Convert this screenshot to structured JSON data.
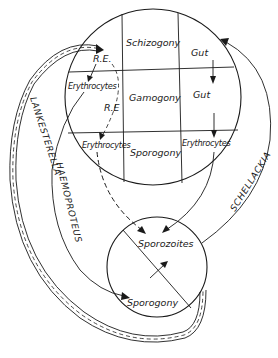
{
  "diagram": {
    "colors": {
      "ink": "#1a1a1a",
      "background": "#ffffff"
    },
    "host_circle": {
      "grid": {
        "rows": [
          [
            "R.E.",
            "Schizogony",
            "Gut"
          ],
          [
            "Erythrocytes",
            "Gamogony",
            "Gut"
          ],
          [
            "Erythrocytes",
            "Sporogony",
            "Erythrocytes"
          ]
        ],
        "row_labels": [
          "Schizogony",
          "Gamogony",
          "Sporogony"
        ]
      },
      "labels": {
        "re_top": "R.E.",
        "schizogony": "Schizogony",
        "gut_top": "Gut",
        "erythrocytes_mid": "Erythrocytes",
        "re_mid": "R.E",
        "gamogony": "Gamogony",
        "gut_mid": "Gut",
        "erythrocytes_left": "Erythrocytes",
        "sporogony": "Sporogony",
        "erythrocytes_right": "Erythrocytes"
      }
    },
    "vector_circle": {
      "labels": {
        "sporozoites": "Sporozoites",
        "sporogony": "Sporogony"
      }
    },
    "genus_paths": [
      {
        "name": "LANKESTERELLA",
        "style": "double-line-dashed"
      },
      {
        "name": "HAEMOPROTEUS",
        "style": "solid"
      },
      {
        "name": "SCHELLACKIA",
        "style": "solid"
      }
    ]
  }
}
